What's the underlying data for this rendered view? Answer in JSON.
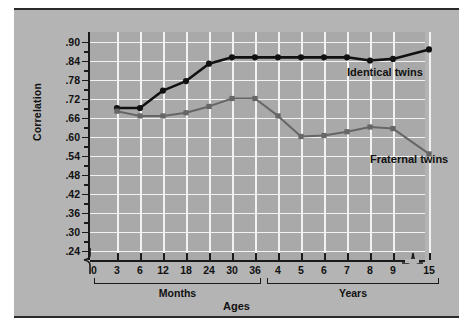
{
  "chart_data": {
    "type": "line",
    "title": "",
    "xlabel": "Ages",
    "ylabel": "Correlation",
    "ylim": [
      0.21,
      0.93
    ],
    "grid": true,
    "legend_position": "inline-right",
    "x_categories": [
      "3",
      "6",
      "12",
      "18",
      "24",
      "30",
      "36",
      "4",
      "5",
      "6",
      "7",
      "8",
      "9",
      "15"
    ],
    "x_origin_label": "0",
    "x_group_labels": [
      "Months",
      "Years"
    ],
    "x_axis_break_between": [
      "9",
      "15"
    ],
    "y_ticks": [
      ".90",
      ".84",
      ".78",
      ".72",
      ".66",
      ".60",
      ".54",
      ".48",
      ".42",
      ".36",
      ".30",
      ".24"
    ],
    "y_tick_values": [
      0.9,
      0.84,
      0.78,
      0.72,
      0.66,
      0.6,
      0.54,
      0.48,
      0.42,
      0.36,
      0.3,
      0.24
    ],
    "y_axis_break": true,
    "series": [
      {
        "name": "Identical twins",
        "color": "#111111",
        "marker": "circle",
        "values": [
          0.69,
          0.69,
          0.745,
          0.775,
          0.83,
          0.85,
          0.85,
          0.85,
          0.85,
          0.85,
          0.85,
          0.84,
          0.845,
          0.875
        ]
      },
      {
        "name": "Fraternal twins",
        "color": "#666666",
        "marker": "square",
        "values": [
          0.68,
          0.665,
          0.665,
          0.675,
          0.695,
          0.72,
          0.72,
          0.665,
          0.6,
          0.603,
          0.615,
          0.63,
          0.625,
          0.545
        ]
      }
    ],
    "annotations": [
      {
        "text": "Identical twins",
        "x_index": 10,
        "y": 0.8
      },
      {
        "text": "Fraternal twins",
        "x_index": 11,
        "y": 0.525
      }
    ]
  }
}
